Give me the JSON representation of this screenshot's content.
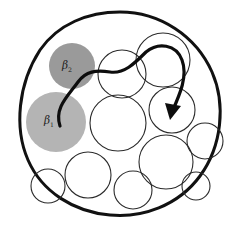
{
  "figure": {
    "width": 242,
    "height": 227,
    "background_color": "#ffffff"
  },
  "colors": {
    "outline": "#111111",
    "circle_stroke": "#2b2b2b",
    "circle_fill": "#ffffff",
    "beta2_fill": "#9a9a9a",
    "beta1_fill": "#b4b4b4",
    "arrow": "#0d0d0d",
    "label": "#1c1c1c"
  },
  "boundary": {
    "name": "outer-region",
    "shape": "blob-ellipse",
    "cx": 120,
    "cy": 114,
    "rx": 97,
    "ry": 102,
    "stroke_width": 3.0,
    "fill": "none"
  },
  "labels": [
    {
      "id": "beta1",
      "base": "β",
      "subscript": "1",
      "x": 44,
      "y": 124,
      "font_size": 10.5
    },
    {
      "id": "beta2",
      "base": "β",
      "subscript": "2",
      "x": 62,
      "y": 69,
      "font_size": 10.5
    }
  ],
  "filled_circles": [
    {
      "id": "beta2-circle",
      "name": "shaded-circle-beta2",
      "cx": 72,
      "cy": 66,
      "r": 23,
      "fill": "#9a9a9a",
      "shade": "dark-gray"
    },
    {
      "id": "beta1-circle",
      "name": "shaded-circle-beta1",
      "cx": 56,
      "cy": 122,
      "r": 30,
      "fill": "#b4b4b4",
      "shade": "light-gray"
    }
  ],
  "open_circles": [
    {
      "id": "c1",
      "cx": 122,
      "cy": 74,
      "r": 24
    },
    {
      "id": "c2",
      "cx": 163,
      "cy": 60,
      "r": 27
    },
    {
      "id": "c3",
      "cx": 118,
      "cy": 123,
      "r": 28
    },
    {
      "id": "c4",
      "cx": 172,
      "cy": 110,
      "r": 23
    },
    {
      "id": "c5",
      "cx": 166,
      "cy": 162,
      "r": 27
    },
    {
      "id": "c6",
      "cx": 205,
      "cy": 141,
      "r": 18
    },
    {
      "id": "c7",
      "cx": 88,
      "cy": 175,
      "r": 23
    },
    {
      "id": "c8",
      "cx": 133,
      "cy": 190,
      "r": 19
    },
    {
      "id": "c9",
      "cx": 48,
      "cy": 186,
      "r": 17
    },
    {
      "id": "c10",
      "cx": 196,
      "cy": 186,
      "r": 14
    }
  ],
  "arrow": {
    "name": "trajectory-arrow",
    "stroke_width": 3.2,
    "start": {
      "x": 60,
      "y": 126
    },
    "end": {
      "x": 172,
      "y": 114
    },
    "head_size": 11,
    "description": "curve from beta1 through beta2 edge, across top, down into right circle",
    "path": "M 60 126 C 54 108 68 96 78 82 C 86 71 96 70 110 72 C 124 74 134 64 146 52 C 158 42 176 44 182 60 C 188 76 180 94 172 112"
  },
  "meta": {
    "circle_count_open": 10,
    "circle_count_filled": 2
  }
}
